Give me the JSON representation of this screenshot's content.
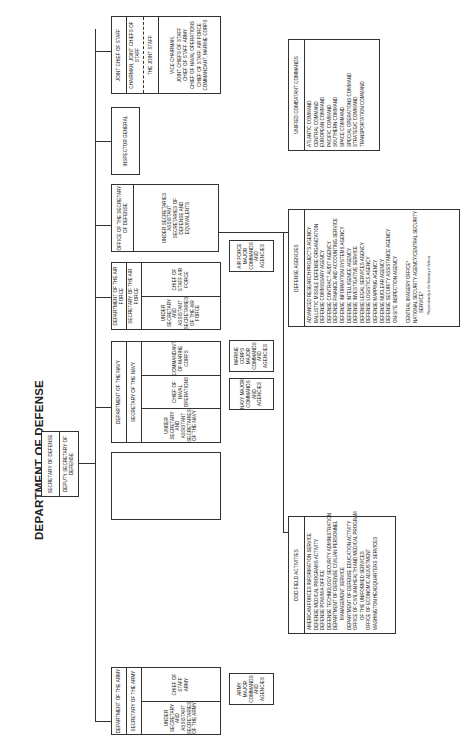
{
  "title": "DEPARTMENT OF DEFENSE",
  "secretary": {
    "top": "SECRETARY OF DEFENSE",
    "deputy": "DEPUTY SECRETARY OF DEFENSE"
  },
  "joint_chiefs": {
    "header": "JOINT CHIEF OF STAFF",
    "chairman": "CHAIRMAN, JOINT CHIEFS OF STAFF",
    "joint_staff": "THE JOINT STAFF",
    "members": [
      "VICE CHAIRMAN,",
      "JOINT CHIEFS OF STAFF",
      "CHIEF OF STAFF, ARMY",
      "CHIEF OF NAVAL OPERATIONS",
      "CHIEF OF STAFF, AIR FORCE",
      "COMMANDANT, MARINE CORPS"
    ]
  },
  "inspector_general": "INSPECTOR GENERAL",
  "osd": {
    "header": "OFFICE OF THE SECRETARY OF DEFENSE",
    "body": "UNDER SECRETARIES ASSISTANT SECRETARIES OF DEFENSE AND EQUIVALENTS"
  },
  "air_force": {
    "header": "DEPARTMENT OF THE AIR FORCE",
    "secretary": "SECRETARY OF THE AIR FORCE",
    "under": "UNDER SECRETARY AND ASSISTANT SECRETARIES OF THE AIR FORCE",
    "chief": "CHIEF OF STAFF AIR FORCE",
    "commands": "AIR FORCE MAJOR COMMANDS AND AGENCIES"
  },
  "navy": {
    "header": "DEPARTMENT OF THE NAVY",
    "secretary": "SECRETARY OF THE NAVY",
    "under": "UNDER SECRETARY AND ASSISTANT SECRETARIES OF THE NAVY",
    "cno": "CHIEF OF NAVAL OPERATIONS",
    "commandant": "COMMANDANT OF MARINE CORPS",
    "navy_commands": "NAVY MAJOR COMMANDS AND AGENCIES",
    "marine_commands": "MARINE CORPS MAJOR COMMANDS AND AGENCIES"
  },
  "army": {
    "header": "DEPARTMENT OF THE ARMY",
    "secretary": "SECRETARY OF THE ARMY",
    "under": "UNDER SECRETARY AND ASSISTANT SECRETARIES OF THE ARMY",
    "chief": "CHIEF OF STAFF ARMY",
    "commands": "ARMY MAJOR COMMANDS AND AGENCIES"
  },
  "unified_commands": {
    "header": "UNIFIED COMBATANT COMMANDS",
    "items": [
      "ATLANTIC COMMAND",
      "CENTRAL COMMAND",
      "EUROPEAN COMMAND",
      "PACIFIC COMMAND",
      "SOUTHERN COMMAND",
      "SPACE COMMAND",
      "SPECIAL OPERATIONS COMMAND",
      "STRATEGIC COMMAND",
      "TRANSPORTATION COMMAND"
    ]
  },
  "defense_agencies": {
    "header": "DEFENSE AGENCIES",
    "items": [
      "ADVANCED RESEARCH PROJECTS AGENCY",
      "BALLISTIC MISSILE DEFENSE ORGANIZATION",
      "DEFENSE COMMISSARY AGENCY",
      "DEFENSE CONTRACT AUDIT AGENCY",
      "DEFENSE FINANCE AND ACCOUNTING SERVICE",
      "DEFENSE INFORMATION SYSTEMS AGENCY",
      "DEFENSE INTELLIGENCE AGENCY",
      "DEFENSE INVESTIGATIVE SERVICE",
      "DEFENSE LEGAL SERVICES AGENCY",
      "DEFENSE LOGISTICS AGENCY",
      "DEFENSE MAPPING AGENCY",
      "DEFENSE NUCLEAR AGENCY",
      "DEFENSE SECURITY ASSISTANCE AGENCY",
      "ON-SITE INSPECTION AGENCY",
      "",
      "CENTRAL IMAGERY OFFICE*",
      "NATIONAL SECURITY AGENCY/CENTRAL SECURITY",
      "SERVICE*"
    ],
    "footnote": "*Reports directly to the Secretary of Defense"
  },
  "field_activities": {
    "header": "DOD FIELD ACTIVITIES",
    "items": [
      "AMERICAN FORCES INFORMATION SERVICE",
      "DEFENSE MEDICAL PROGRAMS ACTIVITY",
      "DEFENSE POW/MIA OFFICE",
      "DEFENSE TECHNOLOGY SECURITY ADMINISTRATION",
      "DEPARTMENT OF DEFENSE CIVILIAN PERSONNEL",
      "MANAGEMENT SERVICE",
      "DEPARTMENT OF DEFENSE EDUCATION ACTIVITY",
      "OFFICE OF CIVILIAN HEALTH AND MEDICAL PROGRAM",
      "OF THE UNIFORMED SERVICES",
      "OFFICE OF ECONOMIC ADJUSTMENT",
      "WASHINGTON HEADQUARTERS SERVICES"
    ]
  }
}
